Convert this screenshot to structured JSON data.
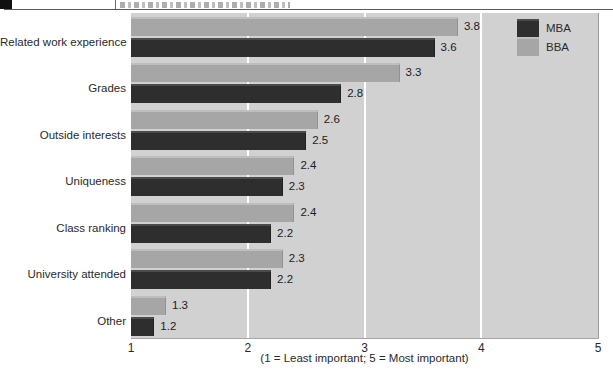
{
  "chart_data": {
    "type": "bar",
    "orientation": "horizontal",
    "title": "",
    "categories": [
      "Related work experience",
      "Grades",
      "Outside interests",
      "Uniqueness",
      "Class ranking",
      "University attended",
      "Other"
    ],
    "series": [
      {
        "name": "MBA",
        "color": "#2e2e2e",
        "values": [
          3.6,
          2.8,
          2.5,
          2.3,
          2.2,
          2.2,
          1.2
        ]
      },
      {
        "name": "BBA",
        "color": "#a6a6a6",
        "values": [
          3.8,
          3.3,
          2.6,
          2.4,
          2.4,
          2.3,
          1.3
        ]
      }
    ],
    "bar_order_top_to_bottom": [
      "BBA",
      "MBA"
    ],
    "xlabel": "(1 = Least important; 5 = Most important)",
    "xlim": [
      1,
      5
    ],
    "xticks": [
      1,
      2,
      3,
      4,
      5
    ],
    "gridlines_at": [
      2,
      3,
      4
    ],
    "grid_color": "#ffffff",
    "plot_background": "#d1d1d1",
    "value_labels_shown": true,
    "legend": {
      "position": "top-right",
      "entries": [
        "MBA",
        "BBA"
      ]
    }
  }
}
